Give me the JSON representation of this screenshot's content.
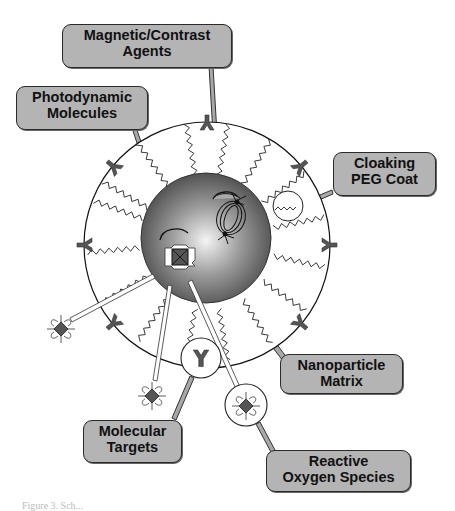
{
  "diagram": {
    "labels": {
      "magnetic": {
        "line1": "Magnetic/Contrast",
        "line2": "Agents"
      },
      "photodynamic": {
        "line1": "Photodynamic",
        "line2": "Molecules"
      },
      "cloaking": {
        "line1": "Cloaking",
        "line2": "PEG Coat"
      },
      "matrix": {
        "line1": "Nanoparticle",
        "line2": "Matrix"
      },
      "targets": {
        "line1": "Molecular",
        "line2": "Targets"
      },
      "ros": {
        "line1": "Reactive",
        "line2": "Oxygen Species"
      }
    },
    "colors": {
      "label_fill": "#b4b4b4",
      "outline": "#2a2a2a",
      "core_dark": "#3a3a3a",
      "core_light": "#f2f2f2",
      "ligand": "#555555",
      "connector": "#a8a8a8"
    }
  },
  "caption": "Figure 3. Sch..."
}
